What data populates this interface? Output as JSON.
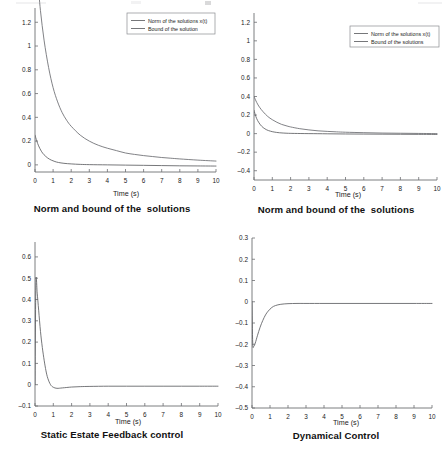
{
  "figure": {
    "panel_count": 4,
    "background_color": "#ffffff",
    "curve_color": "#5d5f62",
    "axis_color": "#6d6f72"
  },
  "panels": [
    {
      "id": "panel-top-left",
      "title": "Norm and bound of the  solutions",
      "xlabel": "Time (s)",
      "legend": [
        "Norm of the solutions x(t)",
        "Bound of the solution"
      ]
    },
    {
      "id": "panel-top-right",
      "title": "Norm and bound of the  solutions",
      "xlabel": "Time (s)",
      "legend": [
        "Norm of the solutions x(t)",
        "Bound of the  solutions"
      ]
    },
    {
      "id": "panel-bottom-left",
      "title": "Static Estate Feedback control",
      "xlabel": "Time (s)",
      "legend": []
    },
    {
      "id": "panel-bottom-right",
      "title": "Dynamical Control",
      "xlabel": "Time (s)",
      "legend": []
    }
  ],
  "chart_data": [
    {
      "type": "line",
      "title": "Norm and bound of the  solutions",
      "xlabel": "Time (s)",
      "ylabel": "",
      "xlim": [
        0,
        10
      ],
      "ylim": [
        -0.06,
        1.32
      ],
      "grid": false,
      "legend_position": "top-right",
      "xticks": [
        0,
        1,
        2,
        3,
        4,
        5,
        6,
        7,
        8,
        9,
        10
      ],
      "xticklabels": [
        "0",
        "1",
        "2",
        "3",
        "4",
        "5",
        "6",
        "7",
        "8",
        "9",
        "10"
      ],
      "yticks": [
        0,
        0.2,
        0.4,
        0.6,
        0.8,
        1,
        1.2
      ],
      "yticklabels": [
        "0",
        "0.2",
        "0.4",
        "0.6",
        "0.8",
        "1",
        "1.2"
      ],
      "series": [
        {
          "name": "Bound of the solution",
          "x": [
            0,
            0.15,
            0.3,
            0.5,
            0.75,
            1.0,
            1.25,
            1.5,
            1.75,
            2.0,
            2.5,
            3.0,
            3.5,
            4.0,
            4.5,
            5.0,
            5.5,
            6.0,
            6.5,
            7.0,
            7.5,
            8.0,
            9.0,
            10.0
          ],
          "y": [
            1.85,
            1.55,
            1.3,
            1.05,
            0.82,
            0.65,
            0.53,
            0.44,
            0.375,
            0.325,
            0.25,
            0.2,
            0.165,
            0.14,
            0.12,
            0.1,
            0.088,
            0.078,
            0.07,
            0.062,
            0.056,
            0.05,
            0.04,
            0.032
          ]
        },
        {
          "name": "Norm of the solutions x(t)",
          "x": [
            0,
            0.1,
            0.2,
            0.35,
            0.5,
            0.7,
            0.9,
            1.1,
            1.3,
            1.6,
            2.0,
            2.5,
            3.0,
            4.0,
            5.0,
            6.0,
            7.0,
            8.0,
            9.0,
            10.0
          ],
          "y": [
            0.25,
            0.2,
            0.16,
            0.115,
            0.085,
            0.058,
            0.04,
            0.028,
            0.02,
            0.013,
            0.008,
            0.004,
            0.002,
            0.0,
            -0.002,
            -0.004,
            -0.006,
            -0.008,
            -0.009,
            -0.01
          ]
        }
      ]
    },
    {
      "type": "line",
      "title": "Norm and bound of the  solutions",
      "xlabel": "Time (s)",
      "ylabel": "",
      "xlim": [
        0,
        10
      ],
      "ylim": [
        -0.5,
        1.3
      ],
      "grid": false,
      "legend_position": "top-right",
      "xticks": [
        0,
        1,
        2,
        3,
        4,
        5,
        6,
        7,
        8,
        9,
        10
      ],
      "xticklabels": [
        "0",
        "1",
        "2",
        "3",
        "4",
        "5",
        "6",
        "7",
        "8",
        "9",
        "10"
      ],
      "yticks": [
        -0.4,
        -0.2,
        0,
        0.2,
        0.4,
        0.6,
        0.8,
        1,
        1.2
      ],
      "yticklabels": [
        "-0.4",
        "-0.2",
        "0",
        "0.2",
        "0.4",
        "0.6",
        "0.8",
        "1",
        "1.2"
      ],
      "series": [
        {
          "name": "Bound of the  solutions",
          "x": [
            0,
            0.15,
            0.3,
            0.5,
            0.75,
            1.0,
            1.25,
            1.5,
            1.75,
            2.0,
            2.5,
            3.0,
            3.5,
            4.0,
            4.5,
            5.0,
            6.0,
            7.0,
            8.0,
            9.0,
            10.0
          ],
          "y": [
            0.4,
            0.335,
            0.285,
            0.235,
            0.185,
            0.15,
            0.122,
            0.1,
            0.085,
            0.072,
            0.053,
            0.04,
            0.03,
            0.024,
            0.019,
            0.015,
            0.01,
            0.006,
            0.004,
            0.002,
            0.0
          ]
        },
        {
          "name": "Norm of the solutions x(t)",
          "x": [
            0,
            0.1,
            0.2,
            0.35,
            0.5,
            0.7,
            0.9,
            1.1,
            1.4,
            1.8,
            2.2,
            3.0,
            4.0,
            5.0,
            6.0,
            7.0,
            8.0,
            9.0,
            10.0
          ],
          "y": [
            0.25,
            0.185,
            0.14,
            0.095,
            0.065,
            0.04,
            0.026,
            0.017,
            0.009,
            0.004,
            0.002,
            0.0,
            -0.002,
            -0.004,
            -0.005,
            -0.006,
            -0.007,
            -0.008,
            -0.009
          ]
        }
      ]
    },
    {
      "type": "line",
      "title": "Static Estate Feedback control",
      "xlabel": "Time (s)",
      "ylabel": "",
      "xlim": [
        0,
        10
      ],
      "ylim": [
        -0.1,
        0.67
      ],
      "grid": false,
      "legend_position": "none",
      "xticks": [
        0,
        1,
        2,
        3,
        4,
        5,
        6,
        7,
        8,
        9,
        10
      ],
      "xticklabels": [
        "0",
        "1",
        "2",
        "3",
        "4",
        "5",
        "6",
        "7",
        "8",
        "9",
        "10"
      ],
      "yticks": [
        -0.1,
        0,
        0.1,
        0.2,
        0.3,
        0.4,
        0.5,
        0.6
      ],
      "yticklabels": [
        "-0.1",
        "0",
        "0.1",
        "0.2",
        "0.3",
        "0.4",
        "0.5",
        "0.6"
      ],
      "series": [
        {
          "name": "Static state feedback control u(t)",
          "x": [
            0,
            0.05,
            0.12,
            0.2,
            0.3,
            0.4,
            0.5,
            0.6,
            0.7,
            0.85,
            1.0,
            1.2,
            1.5,
            2.0,
            2.5,
            3.0,
            4.0,
            5.0,
            6.0,
            7.0,
            8.0,
            9.0,
            10.0
          ],
          "y": [
            0.0,
            0.48,
            0.43,
            0.35,
            0.25,
            0.175,
            0.115,
            0.065,
            0.03,
            0.0,
            -0.012,
            -0.017,
            -0.015,
            -0.011,
            -0.009,
            -0.008,
            -0.007,
            -0.007,
            -0.007,
            -0.007,
            -0.007,
            -0.007,
            -0.007
          ]
        }
      ]
    },
    {
      "type": "line",
      "title": "Dynamical Control",
      "xlabel": "Time (s)",
      "ylabel": "",
      "xlim": [
        0,
        10
      ],
      "ylim": [
        -0.5,
        0.3
      ],
      "grid": false,
      "legend_position": "none",
      "xticks": [
        0,
        1,
        2,
        3,
        4,
        5,
        6,
        7,
        8,
        9,
        10
      ],
      "xticklabels": [
        "0",
        "1",
        "2",
        "3",
        "4",
        "5",
        "6",
        "7",
        "8",
        "9",
        "10"
      ],
      "yticks": [
        -0.5,
        -0.4,
        -0.3,
        -0.2,
        -0.1,
        0,
        0.1,
        0.2,
        0.3
      ],
      "yticklabels": [
        "-0.5",
        "-0.4",
        "-0.3",
        "-0.2",
        "-0.1",
        "0",
        "0.1",
        "0.2",
        "0.3"
      ],
      "series": [
        {
          "name": "Dynamical control u(t)",
          "x": [
            0,
            0.04,
            0.1,
            0.18,
            0.3,
            0.45,
            0.6,
            0.75,
            0.9,
            1.1,
            1.3,
            1.6,
            2.0,
            2.5,
            3.0,
            4.0,
            5.0,
            6.0,
            7.0,
            8.0,
            9.0,
            10.0
          ],
          "y": [
            0.0,
            -0.195,
            -0.21,
            -0.195,
            -0.16,
            -0.12,
            -0.088,
            -0.062,
            -0.044,
            -0.027,
            -0.018,
            -0.012,
            -0.009,
            -0.008,
            -0.008,
            -0.008,
            -0.008,
            -0.008,
            -0.008,
            -0.008,
            -0.008,
            -0.008
          ]
        }
      ]
    }
  ]
}
